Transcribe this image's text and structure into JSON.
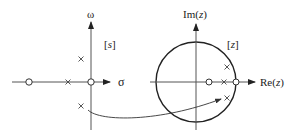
{
  "s_plane": {
    "bracket_label": "[s]",
    "bracket_label_var": "s",
    "x_axis_label": "σ",
    "y_axis_label": "ω",
    "poles": [
      {
        "x": 81,
        "y": 59
      },
      {
        "x": 68,
        "y": 82
      },
      {
        "x": 81,
        "y": 106
      }
    ],
    "zeros": [
      {
        "x": 29,
        "y": 82
      },
      {
        "x": 91,
        "y": 82
      }
    ]
  },
  "z_plane": {
    "bracket_label": "[z]",
    "bracket_label_var": "z",
    "x_axis_label": "Re(z)",
    "y_axis_label": "Im(z)",
    "unit_circle": {
      "cx": 196,
      "cy": 82,
      "r": 40
    },
    "poles": [
      {
        "x": 227,
        "y": 67
      },
      {
        "x": 224,
        "y": 82
      },
      {
        "x": 227,
        "y": 98
      }
    ],
    "zeros": [
      {
        "x": 209,
        "y": 82
      },
      {
        "x": 236,
        "y": 82
      }
    ]
  },
  "mapping_arrow": {
    "description": "mapping from s-plane pole to z-plane pole"
  },
  "colors": {
    "line": "#333333",
    "axis": "#555555",
    "background": "#ffffff"
  }
}
